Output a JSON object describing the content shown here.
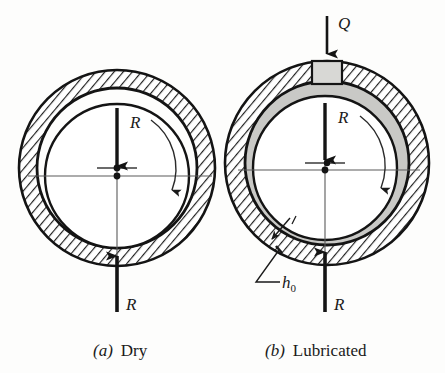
{
  "figure": {
    "background_color": "#fdfdfc",
    "ink_color": "#1a1a1a",
    "oil_film_color": "#c9c9c6",
    "oil_port_color": "#d8d8d5",
    "hatch_color": "#222222"
  },
  "panels": [
    {
      "id": "dry",
      "caption_marker": "(a)",
      "caption_text": "Dry",
      "caption_full": "(a)  Dry",
      "center": {
        "x": 117,
        "y": 168
      },
      "bearing_outer_r": 98,
      "bearing_inner_r": 80,
      "journal_r": 72,
      "journal_center": {
        "x": 117,
        "y": 176
      },
      "has_oil_film": false,
      "has_oil_port": false,
      "labels": {
        "load": "R",
        "reaction": "R"
      },
      "load_arrow": {
        "from": {
          "x": 117,
          "y": 108
        },
        "to": {
          "x": 117,
          "y": 170
        }
      },
      "reaction_arrow": {
        "from": {
          "x": 117,
          "y": 312
        },
        "to": {
          "x": 117,
          "y": 252
        }
      },
      "rotation": "clockwise"
    },
    {
      "id": "lubricated",
      "caption_marker": "(b)",
      "caption_text": "Lubricated",
      "caption_full": "(b)  Lubricated",
      "center": {
        "x": 327,
        "y": 163
      },
      "bearing_outer_r": 102,
      "bearing_inner_r": 82,
      "journal_r": 72,
      "journal_center": {
        "x": 325,
        "y": 168
      },
      "has_oil_film": true,
      "has_oil_port": true,
      "labels": {
        "load": "R",
        "reaction": "R",
        "flow": "Q",
        "min_film_thickness": "h",
        "min_film_thickness_sub": "0",
        "min_film_thickness_full": "h0"
      },
      "load_arrow": {
        "from": {
          "x": 325,
          "y": 103
        },
        "to": {
          "x": 325,
          "y": 164
        }
      },
      "reaction_arrow": {
        "from": {
          "x": 325,
          "y": 312
        },
        "to": {
          "x": 325,
          "y": 248
        }
      },
      "flow_arrow": {
        "from": {
          "x": 327,
          "y": 16
        },
        "to": {
          "x": 327,
          "y": 58
        }
      },
      "rotation": "clockwise"
    }
  ],
  "captions": {
    "left_marker": "(a)",
    "left_label": "Dry",
    "right_marker": "(b)",
    "right_label": "Lubricated"
  }
}
